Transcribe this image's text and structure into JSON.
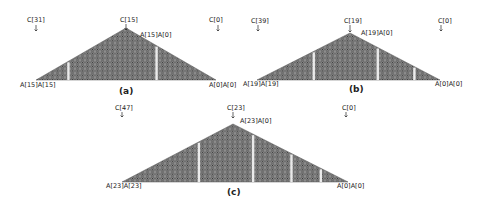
{
  "figure": {
    "panels": [
      {
        "id": "a",
        "caption": "(a)",
        "n": 15,
        "column_labels": [
          "C[31]",
          "C[15]",
          "C[0]"
        ],
        "apex_label": "A[15]A[0]",
        "left_label": "A[15]A[15]",
        "right_label": "A[0]A[0]",
        "separators": [
          0.18,
          0.67
        ]
      },
      {
        "id": "b",
        "caption": "(b)",
        "n": 19,
        "column_labels": [
          "C[39]",
          "C[19]",
          "C[0]"
        ],
        "apex_label": "A[19]A[0]",
        "left_label": "A[19]A[19]",
        "right_label": "A[0]A[0]",
        "separators": [
          0.31,
          0.66,
          0.86
        ]
      },
      {
        "id": "c",
        "caption": "(c)",
        "n": 23,
        "column_labels": [
          "C[47]",
          "C[23]",
          "C[0]"
        ],
        "apex_label": "A[23]A[0]",
        "left_label": "A[23]A[23]",
        "right_label": "A[0]A[0]",
        "separators": [
          0.34,
          0.58,
          0.75,
          0.88
        ]
      }
    ],
    "colors": {
      "cell_fill": "#9a9a9a",
      "cell_stroke": "#4a4a4a",
      "dot": "#111111",
      "separator": "#ffffff"
    }
  }
}
